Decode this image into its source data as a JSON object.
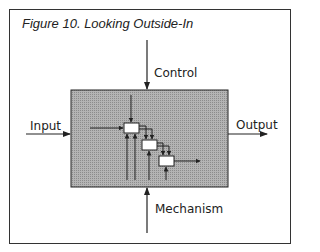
{
  "figure": {
    "title": "Figure 10. Looking Outside-In",
    "labels": {
      "control": "Control",
      "input": "Input",
      "output": "Output",
      "mechanism": "Mechanism"
    },
    "colors": {
      "box_fill": "#a8a8a8",
      "line": "#222222",
      "frame": "#333333"
    },
    "process_boxes": 3
  }
}
